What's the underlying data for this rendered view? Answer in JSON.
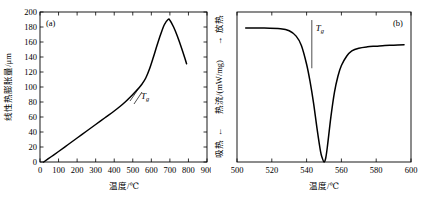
{
  "figure": {
    "panels": [
      {
        "id": "(a)",
        "name": "thermal-expansion-panel",
        "xlabel": "温度/℃",
        "ylabel": "线性热膨胀量/μm",
        "annotation": "T",
        "annotation_sub": "g"
      },
      {
        "id": "(b)",
        "name": "dsc-panel",
        "xlabel": "温度/℃",
        "ylabel_left": "吸热",
        "ylabel_mid": "热流/(mW/mg)",
        "ylabel_right": "放热",
        "arrow_left": "←",
        "arrow_right": "→",
        "annotation": "T",
        "annotation_sub": "g"
      }
    ]
  },
  "chart_data": [
    {
      "type": "line",
      "name": "linear-thermal-expansion",
      "panel": "(a)",
      "title": "",
      "xlabel": "温度/℃",
      "ylabel": "线性热膨胀量/μm",
      "xlim": [
        0,
        900
      ],
      "ylim": [
        0,
        200
      ],
      "xticks": [
        0,
        100,
        200,
        300,
        400,
        500,
        600,
        700,
        800,
        900
      ],
      "xticklabels": [
        "0",
        "100",
        "200",
        "300",
        "400",
        "500",
        "600",
        "700",
        "800",
        "900"
      ],
      "yticks": [
        0,
        20,
        40,
        60,
        80,
        100,
        120,
        140,
        160,
        180,
        200
      ],
      "yticklabels": [
        "0",
        "20",
        "40",
        "60",
        "80",
        "100",
        "120",
        "140",
        "160",
        "180",
        "200"
      ],
      "grid": false,
      "legend": null,
      "annotations": [
        {
          "text": "Tg",
          "x": 560,
          "y": 105,
          "note": "glass transition tangent marker"
        }
      ],
      "x": [
        20,
        60,
        100,
        150,
        200,
        250,
        300,
        350,
        400,
        450,
        500,
        530,
        550,
        570,
        590,
        610,
        630,
        650,
        670,
        690,
        700,
        720,
        740,
        760,
        780,
        790
      ],
      "y": [
        0,
        7,
        14,
        23,
        32,
        41,
        50,
        59,
        68,
        78,
        90,
        98,
        104,
        112,
        124,
        139,
        155,
        170,
        183,
        190,
        189,
        180,
        168,
        154,
        139,
        131
      ]
    },
    {
      "type": "line",
      "name": "dsc-heat-flow",
      "panel": "(b)",
      "title": "",
      "xlabel": "温度/℃",
      "ylabel": "吸热 ← 热流/(mW/mg) → 放热",
      "xlim": [
        500,
        600
      ],
      "ylim": [
        -1.0,
        0.12
      ],
      "xticks": [
        500,
        520,
        540,
        560,
        580,
        600
      ],
      "xticklabels": [
        "500",
        "520",
        "540",
        "560",
        "580",
        "600"
      ],
      "yticks": [],
      "yticklabels": [],
      "grid": false,
      "legend": null,
      "annotations": [
        {
          "text": "Tg",
          "x": 543,
          "y": 0.02,
          "note": "onset vertical marker line"
        }
      ],
      "x": [
        505,
        515,
        525,
        530,
        534,
        537,
        540,
        542,
        544,
        546,
        548,
        549,
        550,
        551,
        552,
        554,
        556,
        558,
        560,
        563,
        566,
        570,
        575,
        580,
        585,
        590,
        596
      ],
      "y": [
        0.0,
        0.0,
        -0.005,
        -0.02,
        -0.06,
        -0.13,
        -0.27,
        -0.4,
        -0.56,
        -0.75,
        -0.92,
        -0.97,
        -1.0,
        -0.97,
        -0.88,
        -0.66,
        -0.48,
        -0.36,
        -0.28,
        -0.21,
        -0.17,
        -0.15,
        -0.14,
        -0.135,
        -0.13,
        -0.128,
        -0.125
      ]
    }
  ]
}
